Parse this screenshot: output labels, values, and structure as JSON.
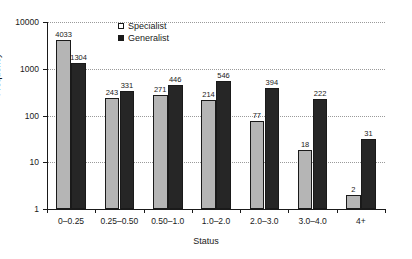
{
  "chart_data": {
    "type": "bar",
    "title": "",
    "xlabel": "Status",
    "ylabel": "Frequency",
    "yscale": "log",
    "ylim": [
      1,
      10000
    ],
    "ytick_labels": [
      "10000",
      "1000",
      "100",
      "10",
      "1"
    ],
    "ytick_values": [
      10000,
      1000,
      100,
      10,
      1
    ],
    "grid": true,
    "grid_style": "dotted",
    "legend_position": "top-center-left",
    "categories": [
      "0–0.25",
      "0.25–0.50",
      "0.50–1.0",
      "1.0–2.0",
      "2.0–3.0",
      "3.0–4.0",
      "4+"
    ],
    "series": [
      {
        "name": "Specialist",
        "color": "#b5b5b5",
        "values": [
          4033,
          243,
          271,
          214,
          77,
          18,
          2
        ]
      },
      {
        "name": "Generalist",
        "color": "#262626",
        "values": [
          1304,
          331,
          446,
          546,
          394,
          222,
          31
        ]
      }
    ]
  },
  "legend": {
    "items": [
      {
        "label": "Specialist",
        "swatch": "open-square-swatch"
      },
      {
        "label": "Generalist",
        "swatch": "filled-square-swatch"
      }
    ]
  },
  "axes": {
    "y_title": "Frequency",
    "x_title": "Status"
  },
  "colors": {
    "specialist": "#b5b5b5",
    "generalist": "#262626",
    "axis": "#1a1a1a",
    "grid": "#9a9a9a",
    "background": "#ffffff"
  }
}
